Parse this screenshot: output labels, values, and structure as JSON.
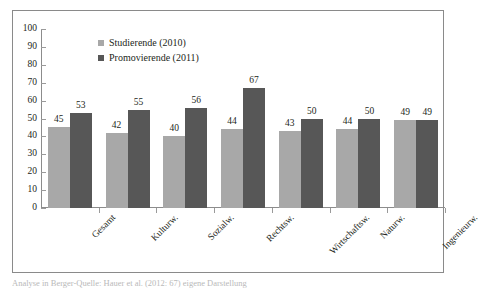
{
  "chart_data": {
    "type": "bar",
    "title": "",
    "xlabel": "",
    "ylabel": "",
    "ylim": [
      0,
      100
    ],
    "yticks": [
      0,
      10,
      20,
      30,
      40,
      50,
      60,
      70,
      80,
      90,
      100
    ],
    "grid": false,
    "legend_position": "top-center-inside",
    "categories": [
      "Gesamt",
      "Kulturw.",
      "Sozialw.",
      "Rechtsw.",
      "Wirtschaftsw.",
      "Naturw.",
      "Ingenieurw."
    ],
    "series": [
      {
        "name": "Studierende (2010)",
        "color": "#a8a8a8",
        "values": [
          45,
          42,
          40,
          44,
          43,
          44,
          49
        ]
      },
      {
        "name": "Promovierende (2011)",
        "color": "#575757",
        "values": [
          53,
          55,
          56,
          67,
          50,
          50,
          49
        ]
      }
    ]
  },
  "caption": {
    "text": "Analyse in Berger-Quelle: Hauer et al. (2012: 67) eigene Darstellung"
  },
  "colors": {
    "series_light": "#a8a8a8",
    "series_dark": "#575757",
    "axis": "#8c8c8c",
    "frame": "#8a8a8a",
    "text": "#231f20"
  }
}
